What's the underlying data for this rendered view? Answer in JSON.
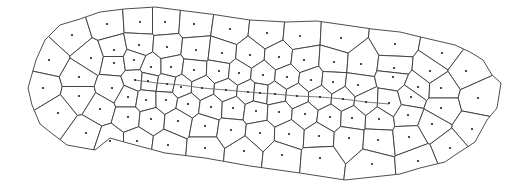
{
  "diagram": {
    "type": "voronoi",
    "width": 517,
    "height": 189,
    "colors": {
      "background": "#ffffff",
      "cell_stroke": "#3a3a3a",
      "seed": "#1e1e1e",
      "path_line": "#6a6a6a"
    },
    "boundary": [
      [
        28,
        88
      ],
      [
        36,
        60
      ],
      [
        45,
        40
      ],
      [
        60,
        25
      ],
      [
        80,
        19
      ],
      [
        100,
        12
      ],
      [
        124,
        9
      ],
      [
        155,
        7
      ],
      [
        178,
        10
      ],
      [
        210,
        14
      ],
      [
        250,
        20
      ],
      [
        286,
        22
      ],
      [
        317,
        21
      ],
      [
        372,
        29
      ],
      [
        400,
        32
      ],
      [
        425,
        38
      ],
      [
        455,
        45
      ],
      [
        470,
        52
      ],
      [
        483,
        60
      ],
      [
        492,
        75
      ],
      [
        501,
        83
      ],
      [
        497,
        108
      ],
      [
        487,
        120
      ],
      [
        475,
        142
      ],
      [
        455,
        155
      ],
      [
        445,
        162
      ],
      [
        420,
        168
      ],
      [
        400,
        174
      ],
      [
        345,
        180
      ],
      [
        300,
        173
      ],
      [
        250,
        166
      ],
      [
        205,
        158
      ],
      [
        165,
        153
      ],
      [
        135,
        145
      ],
      [
        110,
        138
      ],
      [
        95,
        150
      ],
      [
        67,
        145
      ],
      [
        50,
        132
      ],
      [
        40,
        124
      ],
      [
        32,
        105
      ]
    ],
    "seeds": [
      [
        72,
        35
      ],
      [
        107,
        24
      ],
      [
        140,
        22
      ],
      [
        165,
        22
      ],
      [
        194,
        24
      ],
      [
        230,
        29
      ],
      [
        267,
        33
      ],
      [
        300,
        36
      ],
      [
        341,
        38
      ],
      [
        395,
        44
      ],
      [
        442,
        53
      ],
      [
        49,
        60
      ],
      [
        91,
        58
      ],
      [
        114,
        50
      ],
      [
        139,
        45
      ],
      [
        167,
        47
      ],
      [
        196,
        50
      ],
      [
        222,
        53
      ],
      [
        250,
        55
      ],
      [
        279,
        57
      ],
      [
        304,
        60
      ],
      [
        334,
        62
      ],
      [
        361,
        64
      ],
      [
        394,
        68
      ],
      [
        430,
        71
      ],
      [
        466,
        71
      ],
      [
        43,
        88
      ],
      [
        79,
        77
      ],
      [
        114,
        63
      ],
      [
        134,
        60
      ],
      [
        151,
        67
      ],
      [
        171,
        67
      ],
      [
        194,
        70
      ],
      [
        219,
        71
      ],
      [
        239,
        73
      ],
      [
        263,
        75
      ],
      [
        287,
        77
      ],
      [
        311,
        80
      ],
      [
        333,
        82
      ],
      [
        358,
        85
      ],
      [
        393,
        77
      ],
      [
        418,
        87
      ],
      [
        441,
        88
      ],
      [
        478,
        98
      ],
      [
        79,
        96
      ],
      [
        112,
        88
      ],
      [
        135,
        80
      ],
      [
        148,
        81
      ],
      [
        167,
        84
      ],
      [
        181,
        87
      ],
      [
        202,
        88
      ],
      [
        226,
        90
      ],
      [
        248,
        92
      ],
      [
        260,
        93
      ],
      [
        275,
        94
      ],
      [
        297,
        96
      ],
      [
        320,
        97
      ],
      [
        343,
        99
      ],
      [
        366,
        102
      ],
      [
        389,
        103
      ],
      [
        411,
        97
      ],
      [
        441,
        108
      ],
      [
        58,
        113
      ],
      [
        100,
        109
      ],
      [
        128,
        97
      ],
      [
        146,
        100
      ],
      [
        166,
        100
      ],
      [
        188,
        104
      ],
      [
        211,
        107
      ],
      [
        233,
        108
      ],
      [
        256,
        111
      ],
      [
        279,
        112
      ],
      [
        305,
        114
      ],
      [
        330,
        117
      ],
      [
        352,
        118
      ],
      [
        379,
        119
      ],
      [
        408,
        115
      ],
      [
        432,
        124
      ],
      [
        472,
        129
      ],
      [
        86,
        133
      ],
      [
        128,
        117
      ],
      [
        151,
        119
      ],
      [
        178,
        121
      ],
      [
        205,
        126
      ],
      [
        231,
        130
      ],
      [
        260,
        133
      ],
      [
        289,
        134
      ],
      [
        319,
        136
      ],
      [
        349,
        138
      ],
      [
        378,
        140
      ],
      [
        409,
        137
      ],
      [
        450,
        148
      ],
      [
        110,
        141
      ],
      [
        137,
        141
      ],
      [
        168,
        145
      ],
      [
        205,
        148
      ],
      [
        244,
        151
      ],
      [
        282,
        155
      ],
      [
        320,
        158
      ],
      [
        372,
        164
      ],
      [
        418,
        161
      ]
    ],
    "path_nodes": [
      [
        135,
        80
      ],
      [
        157,
        83
      ],
      [
        181,
        85
      ],
      [
        202,
        88
      ],
      [
        226,
        90
      ],
      [
        248,
        92
      ],
      [
        260,
        93
      ],
      [
        275,
        94
      ],
      [
        297,
        96
      ],
      [
        320,
        97
      ],
      [
        343,
        99
      ],
      [
        366,
        102
      ],
      [
        389,
        104
      ]
    ]
  }
}
